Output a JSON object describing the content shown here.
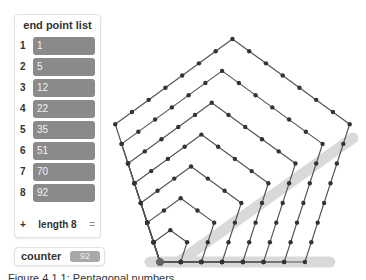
{
  "list_panel": {
    "title": "end point list",
    "items": [
      {
        "index": "1",
        "value": "1"
      },
      {
        "index": "2",
        "value": "5"
      },
      {
        "index": "3",
        "value": "12"
      },
      {
        "index": "4",
        "value": "22"
      },
      {
        "index": "5",
        "value": "35"
      },
      {
        "index": "6",
        "value": "51"
      },
      {
        "index": "7",
        "value": "70"
      },
      {
        "index": "8",
        "value": "92"
      }
    ],
    "add_label": "+",
    "length_label": "length 8",
    "resize_label": "="
  },
  "counter": {
    "label": "counter",
    "value": "92"
  },
  "caption": "Figure 4.1.1: Pentagonal numbers",
  "figure": {
    "pentagon_count": 8,
    "origin": [
      160,
      262
    ],
    "unit": 20.7,
    "line_color": "#555555",
    "dot_color": "#333333",
    "anchor_dot_color": "#666666",
    "highlight_color": "#d9d9d9"
  }
}
